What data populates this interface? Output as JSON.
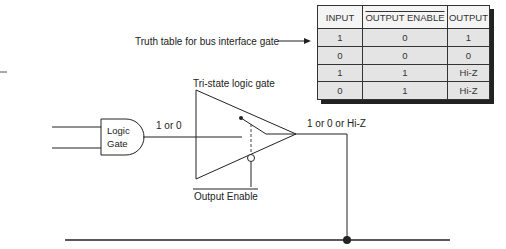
{
  "caption": "Truth table for bus interface gate",
  "truth_table": {
    "headers": [
      "INPUT",
      "OUTPUT ENABLE",
      "OUTPUT"
    ],
    "header_overline": [
      false,
      true,
      false
    ],
    "rows": [
      [
        "1",
        "0",
        "1"
      ],
      [
        "0",
        "0",
        "0"
      ],
      [
        "1",
        "1",
        "Hi-Z"
      ],
      [
        "0",
        "1",
        "Hi-Z"
      ]
    ]
  },
  "diagram": {
    "tristate_label": "Tri-state logic gate",
    "logic_gate_label_line1": "Logic",
    "logic_gate_label_line2": "Gate",
    "gate_output_label": "1 or 0",
    "tristate_output_label": "1 or 0 or Hi-Z",
    "enable_label": "Output Enable"
  },
  "colors": {
    "line": "#222222",
    "table_cell": "#e4e4e4",
    "table_header": "#f4f4f4",
    "shadow": "#222222"
  }
}
